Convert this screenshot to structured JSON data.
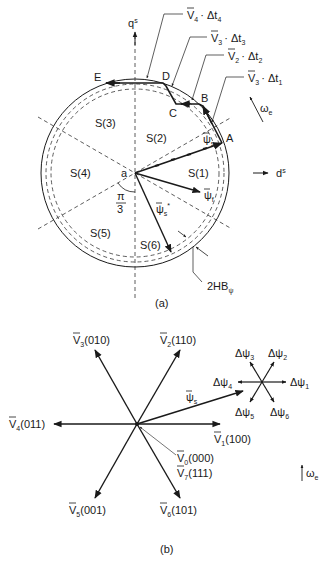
{
  "figure_a": {
    "caption": "(a)",
    "axes": {
      "q": "q",
      "q_sup": "s",
      "d": "d",
      "d_sup": "s"
    },
    "sectors": [
      "S(1)",
      "S(2)",
      "S(3)",
      "S(4)",
      "S(5)",
      "S(6)"
    ],
    "origin_label": "a",
    "angle_label_num": "π",
    "angle_label_den": "3",
    "points": [
      "A",
      "B",
      "C",
      "D",
      "E"
    ],
    "flux_labels": {
      "psi_s": "ψ",
      "psi_s_sub": "s",
      "psi_f": "ψ",
      "psi_f_sub": "f",
      "psi_s_star": "ψ",
      "psi_s_star_sub": "s",
      "psi_s_star_sup": "*"
    },
    "callouts": [
      {
        "v": "V",
        "sub": "4",
        "dt": "· Δt",
        "dt_sub": "4"
      },
      {
        "v": "V",
        "sub": "3",
        "dt": "· Δt",
        "dt_sub": "3"
      },
      {
        "v": "V",
        "sub": "2",
        "dt": "· Δt",
        "dt_sub": "2"
      },
      {
        "v": "V",
        "sub": "3",
        "dt": "· Δt",
        "dt_sub": "1"
      }
    ],
    "omega": "ω",
    "omega_sub": "e",
    "hysteresis": "2HB",
    "hysteresis_sub": "ψ"
  },
  "figure_b": {
    "caption": "(b)",
    "vectors": [
      {
        "v": "V",
        "sub": "1",
        "code": "(100)"
      },
      {
        "v": "V",
        "sub": "2",
        "code": "(110)"
      },
      {
        "v": "V",
        "sub": "3",
        "code": "(010)"
      },
      {
        "v": "V",
        "sub": "4",
        "code": "(011)"
      },
      {
        "v": "V",
        "sub": "5",
        "code": "(001)"
      },
      {
        "v": "V",
        "sub": "6",
        "code": "(101)"
      },
      {
        "v": "V",
        "sub": "0",
        "code": "(000)"
      },
      {
        "v": "V",
        "sub": "7",
        "code": "(111)"
      }
    ],
    "flux": {
      "psi": "ψ",
      "sub": "s"
    },
    "delta_psi": [
      {
        "d": "Δψ",
        "sub": "1"
      },
      {
        "d": "Δψ",
        "sub": "2"
      },
      {
        "d": "Δψ",
        "sub": "3"
      },
      {
        "d": "Δψ",
        "sub": "4"
      },
      {
        "d": "Δψ",
        "sub": "5"
      },
      {
        "d": "Δψ",
        "sub": "6"
      }
    ],
    "omega": "ω",
    "omega_sub": "e"
  }
}
